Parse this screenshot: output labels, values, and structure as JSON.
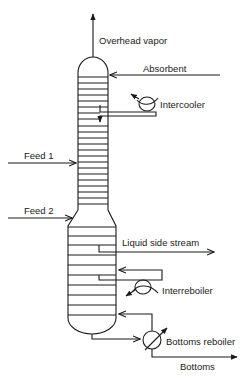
{
  "diagram": {
    "type": "distillation-absorption column with side streams",
    "colors": {
      "stroke": "#1a1a1a",
      "background": "#ffffff"
    },
    "labels": {
      "overhead_vapor": "Overhead vapor",
      "absorbent": "Absorbent",
      "intercooler": "Intercooler",
      "feed_1": "Feed 1",
      "feed_2": "Feed 2",
      "liquid_side_stream": "Liquid side stream",
      "interreboiler": "Interreboiler",
      "bottoms_reboiler": "Bottoms reboiler",
      "bottoms": "Bottoms"
    },
    "sections": {
      "upper_narrow_trays": 24,
      "lower_wide_trays": 11
    },
    "icons": [
      "heat-exchanger-icon",
      "reboiler-icon",
      "arrow-icon"
    ]
  }
}
